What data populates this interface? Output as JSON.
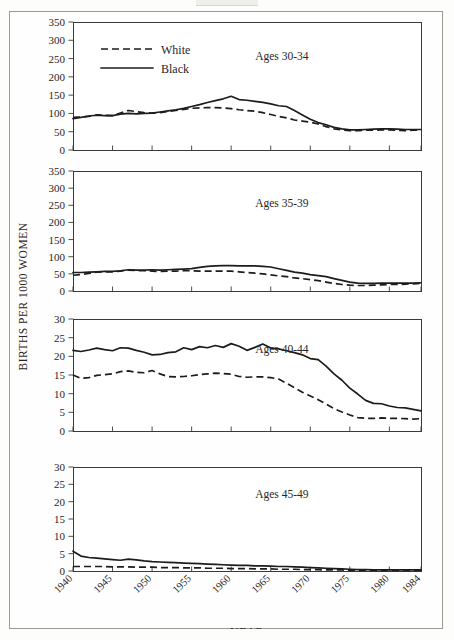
{
  "figure": {
    "ylabel": "BIRTHS PER 1000 WOMEN",
    "xlabel": "YEAR",
    "legend": {
      "white_label": "White",
      "black_label": "Black",
      "white_style": "dashed",
      "black_style": "solid"
    },
    "colors": {
      "line": "#1c1c1a",
      "frame": "#3a3a38",
      "page_border": "#9a9a96",
      "background": "#fefefe"
    }
  },
  "chart_data": [
    {
      "type": "line",
      "title": "Ages 30-34",
      "xlabel": "YEAR",
      "ylabel": "BIRTHS PER 1000 WOMEN",
      "xlim": [
        1940,
        1984
      ],
      "ylim": [
        0,
        350
      ],
      "yticks": [
        0,
        50,
        100,
        150,
        200,
        250,
        300,
        350
      ],
      "xticks": [
        1940,
        1945,
        1950,
        1955,
        1960,
        1965,
        1970,
        1975,
        1980,
        1984
      ],
      "grid": false,
      "legend_position": "top-left",
      "x": [
        1940,
        1941,
        1942,
        1943,
        1944,
        1945,
        1946,
        1947,
        1948,
        1949,
        1950,
        1951,
        1952,
        1953,
        1954,
        1955,
        1956,
        1957,
        1958,
        1959,
        1960,
        1961,
        1962,
        1963,
        1964,
        1965,
        1966,
        1967,
        1968,
        1969,
        1970,
        1971,
        1972,
        1973,
        1974,
        1975,
        1976,
        1977,
        1978,
        1979,
        1980,
        1981,
        1982,
        1983,
        1984
      ],
      "series": [
        {
          "name": "Black",
          "style": "solid",
          "values": [
            86,
            89,
            93,
            95,
            94,
            94,
            98,
            100,
            99,
            100,
            101,
            104,
            107,
            110,
            114,
            119,
            124,
            130,
            135,
            140,
            147,
            138,
            136,
            133,
            130,
            126,
            121,
            119,
            108,
            96,
            84,
            75,
            69,
            62,
            58,
            55,
            55,
            56,
            57,
            58,
            58,
            57,
            56,
            56,
            56
          ]
        },
        {
          "name": "White",
          "style": "dashed",
          "values": [
            89,
            90,
            92,
            96,
            95,
            94,
            101,
            108,
            105,
            102,
            101,
            102,
            105,
            108,
            111,
            114,
            115,
            116,
            116,
            115,
            113,
            110,
            108,
            106,
            102,
            97,
            92,
            88,
            82,
            79,
            76,
            71,
            64,
            58,
            55,
            53,
            53,
            54,
            54,
            55,
            55,
            54,
            53,
            54,
            55
          ]
        }
      ]
    },
    {
      "type": "line",
      "title": "Ages 35-39",
      "xlabel": "YEAR",
      "ylabel": "BIRTHS PER 1000 WOMEN",
      "xlim": [
        1940,
        1984
      ],
      "ylim": [
        0,
        350
      ],
      "yticks": [
        0,
        50,
        100,
        150,
        200,
        250,
        300,
        350
      ],
      "xticks": [
        1940,
        1945,
        1950,
        1955,
        1960,
        1965,
        1970,
        1975,
        1980,
        1984
      ],
      "grid": false,
      "x": [
        1940,
        1941,
        1942,
        1943,
        1944,
        1945,
        1946,
        1947,
        1948,
        1949,
        1950,
        1951,
        1952,
        1953,
        1954,
        1955,
        1956,
        1957,
        1958,
        1959,
        1960,
        1961,
        1962,
        1963,
        1964,
        1965,
        1966,
        1967,
        1968,
        1969,
        1970,
        1971,
        1972,
        1973,
        1974,
        1975,
        1976,
        1977,
        1978,
        1979,
        1980,
        1981,
        1982,
        1983,
        1984
      ],
      "series": [
        {
          "name": "Black",
          "style": "solid",
          "values": [
            54,
            54,
            55,
            56,
            57,
            57,
            59,
            62,
            61,
            61,
            62,
            61,
            62,
            63,
            64,
            65,
            69,
            72,
            73,
            74,
            74,
            73,
            73,
            73,
            72,
            70,
            65,
            60,
            55,
            52,
            48,
            45,
            42,
            36,
            31,
            26,
            23,
            22,
            22,
            23,
            23,
            23,
            23,
            23,
            24
          ]
        },
        {
          "name": "White",
          "style": "dashed",
          "values": [
            46,
            48,
            51,
            55,
            56,
            56,
            58,
            61,
            60,
            59,
            58,
            57,
            58,
            58,
            59,
            59,
            58,
            58,
            58,
            58,
            58,
            56,
            54,
            52,
            50,
            47,
            44,
            42,
            38,
            36,
            33,
            30,
            26,
            22,
            19,
            17,
            16,
            16,
            17,
            18,
            19,
            19,
            20,
            21,
            22
          ]
        }
      ]
    },
    {
      "type": "line",
      "title": "Ages 40-44",
      "xlabel": "YEAR",
      "ylabel": "BIRTHS PER 1000 WOMEN",
      "xlim": [
        1940,
        1984
      ],
      "ylim": [
        0,
        30
      ],
      "yticks": [
        0,
        5,
        10,
        15,
        20,
        25,
        30
      ],
      "xticks": [
        1940,
        1945,
        1950,
        1955,
        1960,
        1965,
        1970,
        1975,
        1980,
        1984
      ],
      "grid": false,
      "x": [
        1940,
        1941,
        1942,
        1943,
        1944,
        1945,
        1946,
        1947,
        1948,
        1949,
        1950,
        1951,
        1952,
        1953,
        1954,
        1955,
        1956,
        1957,
        1958,
        1959,
        1960,
        1961,
        1962,
        1963,
        1964,
        1965,
        1966,
        1967,
        1968,
        1969,
        1970,
        1971,
        1972,
        1973,
        1974,
        1975,
        1976,
        1977,
        1978,
        1979,
        1980,
        1981,
        1982,
        1983,
        1984
      ],
      "series": [
        {
          "name": "Black",
          "style": "solid",
          "values": [
            21.6,
            21.3,
            21.7,
            22.2,
            21.8,
            21.5,
            22.3,
            22.2,
            21.6,
            21.1,
            20.4,
            20.5,
            21.0,
            21.2,
            22.3,
            21.8,
            22.6,
            22.3,
            22.9,
            22.4,
            23.4,
            22.7,
            21.6,
            22.4,
            23.3,
            22.2,
            22.0,
            21.5,
            21.0,
            20.4,
            19.4,
            19.1,
            17.4,
            15.3,
            13.6,
            11.5,
            9.9,
            8.2,
            7.4,
            7.3,
            6.7,
            6.3,
            6.2,
            5.8,
            5.4
          ]
        },
        {
          "name": "White",
          "style": "dashed",
          "values": [
            15.0,
            14.1,
            14.3,
            14.9,
            15.1,
            15.3,
            15.9,
            16.1,
            15.7,
            15.6,
            16.2,
            15.3,
            14.6,
            14.5,
            14.6,
            14.8,
            15.1,
            15.3,
            15.5,
            15.4,
            15.2,
            14.6,
            14.4,
            14.5,
            14.5,
            14.3,
            13.9,
            12.8,
            11.6,
            10.4,
            9.4,
            8.4,
            7.2,
            6.0,
            5.1,
            4.3,
            3.6,
            3.4,
            3.4,
            3.5,
            3.4,
            3.4,
            3.3,
            3.2,
            3.3
          ]
        }
      ]
    },
    {
      "type": "line",
      "title": "Ages 45-49",
      "xlabel": "YEAR",
      "ylabel": "BIRTHS PER 1000 WOMEN",
      "xlim": [
        1940,
        1984
      ],
      "ylim": [
        0,
        30
      ],
      "yticks": [
        0,
        5,
        10,
        15,
        20,
        25,
        30
      ],
      "xticks": [
        1940,
        1945,
        1950,
        1955,
        1960,
        1965,
        1970,
        1975,
        1980,
        1984
      ],
      "grid": false,
      "x": [
        1940,
        1941,
        1942,
        1943,
        1944,
        1945,
        1946,
        1947,
        1948,
        1949,
        1950,
        1951,
        1952,
        1953,
        1954,
        1955,
        1956,
        1957,
        1958,
        1959,
        1960,
        1961,
        1962,
        1963,
        1964,
        1965,
        1966,
        1967,
        1968,
        1969,
        1970,
        1971,
        1972,
        1973,
        1974,
        1975,
        1976,
        1977,
        1978,
        1979,
        1980,
        1981,
        1982,
        1983,
        1984
      ],
      "series": [
        {
          "name": "Black",
          "style": "solid",
          "values": [
            5.7,
            4.3,
            3.9,
            3.7,
            3.5,
            3.3,
            3.1,
            3.4,
            3.2,
            2.9,
            2.7,
            2.6,
            2.5,
            2.4,
            2.3,
            2.2,
            2.1,
            2.0,
            1.9,
            1.8,
            1.7,
            1.6,
            1.6,
            1.5,
            1.5,
            1.4,
            1.3,
            1.3,
            1.2,
            1.1,
            1.0,
            0.9,
            0.8,
            0.7,
            0.6,
            0.5,
            0.4,
            0.4,
            0.3,
            0.3,
            0.3,
            0.3,
            0.3,
            0.3,
            0.3
          ]
        },
        {
          "name": "White",
          "style": "dashed",
          "values": [
            1.3,
            1.3,
            1.3,
            1.3,
            1.3,
            1.2,
            1.2,
            1.2,
            1.1,
            1.1,
            1.1,
            1.0,
            1.0,
            1.0,
            0.9,
            0.9,
            0.9,
            0.8,
            0.8,
            0.8,
            0.7,
            0.7,
            0.7,
            0.6,
            0.6,
            0.6,
            0.5,
            0.5,
            0.5,
            0.4,
            0.4,
            0.4,
            0.3,
            0.3,
            0.3,
            0.2,
            0.2,
            0.2,
            0.2,
            0.2,
            0.2,
            0.2,
            0.2,
            0.2,
            0.2
          ]
        }
      ]
    }
  ]
}
